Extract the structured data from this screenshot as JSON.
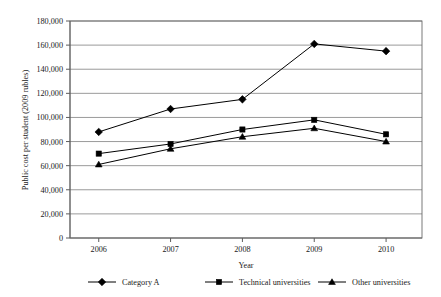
{
  "chart_data": {
    "type": "line",
    "title": "",
    "xlabel": "Year",
    "ylabel": "Public cost per student (2009 rubles)",
    "categories": [
      "2006",
      "2007",
      "2008",
      "2009",
      "2010"
    ],
    "x": [
      2006,
      2007,
      2008,
      2009,
      2010
    ],
    "xlim": [
      2005.6,
      2010.5
    ],
    "ylim": [
      0,
      180000
    ],
    "ytick_values": [
      0,
      20000,
      40000,
      60000,
      80000,
      100000,
      120000,
      140000,
      160000,
      180000
    ],
    "ytick_labels": [
      "0",
      "20,000",
      "40,000",
      "60,000",
      "80,000",
      "100,000",
      "120,000",
      "140,000",
      "160,000",
      "180,000"
    ],
    "grid": true,
    "grid_axis": "y",
    "legend_position": "bottom",
    "series": [
      {
        "name": "Category A",
        "marker": "diamond",
        "color": "#000000",
        "values": [
          88000,
          107000,
          115000,
          161000,
          155000
        ]
      },
      {
        "name": "Technical universities",
        "marker": "square",
        "color": "#000000",
        "values": [
          70000,
          78000,
          90000,
          98000,
          86000
        ]
      },
      {
        "name": "Other universities",
        "marker": "triangle",
        "color": "#000000",
        "values": [
          61000,
          74000,
          84000,
          91000,
          80000
        ]
      }
    ]
  },
  "legend": {
    "items": [
      {
        "label": "Category A",
        "marker": "diamond-marker-icon"
      },
      {
        "label": "Technical universities",
        "marker": "square-marker-icon"
      },
      {
        "label": "Other universities",
        "marker": "triangle-marker-icon"
      }
    ]
  }
}
